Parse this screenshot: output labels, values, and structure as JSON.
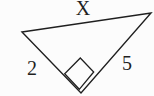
{
  "diagram": {
    "kind": "right-triangle",
    "labels": {
      "top_side": "X",
      "left_side": "2",
      "right_side": "5"
    },
    "right_angle_marker": "square",
    "colors": {
      "line": "#1f1f1f",
      "background": "#fcfcfc"
    }
  }
}
